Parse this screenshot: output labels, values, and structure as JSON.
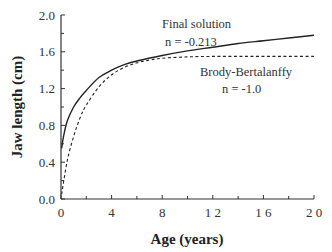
{
  "chart_data": {
    "type": "line",
    "title": "",
    "xlabel": "Age (years)",
    "ylabel": "Jaw length (cm)",
    "xlim": [
      0,
      20
    ],
    "ylim": [
      0.0,
      2.0
    ],
    "x_ticks": [
      0,
      4,
      8,
      12,
      16,
      20
    ],
    "x_tick_labels": [
      "0",
      "4",
      "8",
      "1 2",
      "1 6",
      "2 0"
    ],
    "y_ticks": [
      0.0,
      0.4,
      0.8,
      1.2,
      1.6,
      2.0
    ],
    "y_tick_labels": [
      "0.0",
      "0.4",
      "0.8",
      "1.2",
      "1.6",
      "2.0"
    ],
    "grid": false,
    "legend": "inline annotations",
    "series": [
      {
        "name": "Final solution",
        "annotation": "n  =  -0.213",
        "style": "solid",
        "x": [
          0.05,
          0.2,
          0.5,
          1,
          1.5,
          2,
          3,
          4,
          5,
          6,
          8,
          10,
          12,
          14,
          16,
          18,
          20
        ],
        "values": [
          0.55,
          0.68,
          0.85,
          1.0,
          1.1,
          1.18,
          1.32,
          1.4,
          1.46,
          1.5,
          1.56,
          1.61,
          1.65,
          1.69,
          1.72,
          1.75,
          1.78
        ]
      },
      {
        "name": "Brody-Bertalanffy",
        "annotation": "n = -1.0",
        "style": "dashed",
        "x": [
          0.05,
          0.5,
          1,
          1.5,
          2,
          3,
          4,
          5,
          6,
          7,
          8,
          10,
          12,
          14,
          16,
          18,
          20
        ],
        "values": [
          0.05,
          0.42,
          0.68,
          0.88,
          1.02,
          1.22,
          1.35,
          1.43,
          1.48,
          1.51,
          1.53,
          1.545,
          1.55,
          1.55,
          1.55,
          1.55,
          1.55
        ]
      }
    ],
    "annotations": [
      {
        "text": "Final solution",
        "x": 9.8,
        "y": 1.87
      },
      {
        "text": "n  =  -0.213",
        "x": 9.5,
        "y": 1.71
      },
      {
        "text": "Brody-Bertalanffy",
        "x": 11.5,
        "y": 1.3
      },
      {
        "text": "n = -1.0",
        "x": 12.9,
        "y": 1.14
      }
    ]
  },
  "labels": {
    "final_solution": "Final solution",
    "final_n": "n  =  -0.213",
    "brody": "Brody-Bertalanffy",
    "brody_n": "n = -1.0",
    "xlabel": "Age (years)",
    "ylabel": "Jaw length (cm)"
  },
  "colors": {
    "line": "#222222",
    "axis": "#333333"
  }
}
